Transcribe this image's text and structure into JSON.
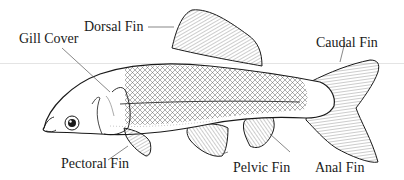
{
  "diagram": {
    "labels": {
      "dorsal_fin": "Dorsal Fin",
      "gill_cover": "Gill Cover",
      "caudal_fin": "Caudal Fin",
      "pectoral_fin": "Pectoral Fin",
      "pelvic_fin": "Pelvic Fin",
      "anal_fin": "Anal Fin"
    },
    "colors": {
      "ink": "#1a1a1a",
      "background": "#ffffff",
      "guide_line": "#e4e4e4"
    }
  }
}
